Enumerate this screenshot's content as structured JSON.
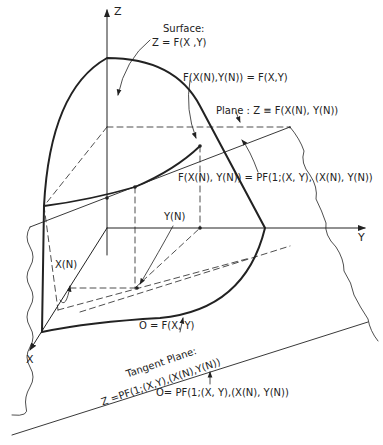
{
  "figure": {
    "axes": {
      "z": "Z",
      "y": "Y",
      "x": "X"
    },
    "labels": {
      "surface_title": "Surface:",
      "surface_eq": "Z = F(X ,Y)",
      "point_eq": "F(X(N),Y(N)) = F(X,Y)",
      "plane_eq": "Plane : Z ≡ F(X(N), Y(N))",
      "tangent_eq": "F(X(N), Y(N)) = PF(1;(X, Y), (X(N), Y(N))",
      "yn": "Y(N)",
      "xn": "X(N)",
      "zero_surface": "O = F(X, Y)",
      "tangent_title": "Tangent   Plane:",
      "tangent_plane_eq": "Z =PF(1;(X,Y),(X(N),Y(N))",
      "zero_tangent": "O= PF(1;(X, Y),(X(N), Y(N))"
    },
    "colors": {
      "ink": "#222222",
      "background": "#ffffff"
    }
  }
}
